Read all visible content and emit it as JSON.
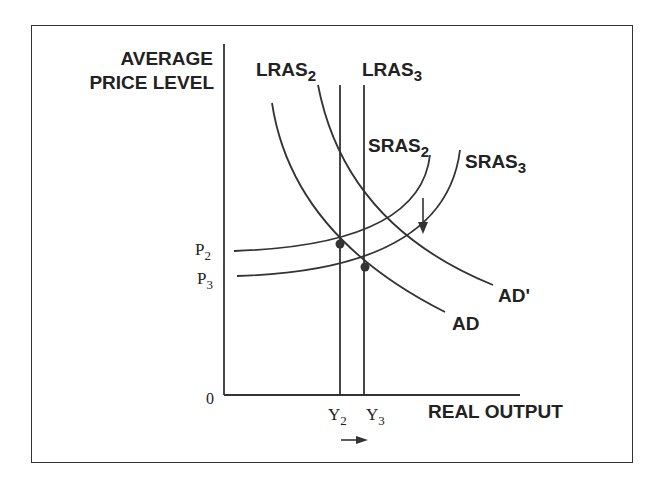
{
  "diagram": {
    "title": "",
    "y_axis": {
      "label_line1": "AVERAGE",
      "label_line2": "PRICE LEVEL"
    },
    "x_axis": {
      "label": "REAL OUTPUT"
    },
    "origin": "0",
    "price_ticks": [
      {
        "label": "P",
        "sub": "2"
      },
      {
        "label": "P",
        "sub": "3"
      }
    ],
    "output_ticks": [
      {
        "label": "Y",
        "sub": "2"
      },
      {
        "label": "Y",
        "sub": "3"
      }
    ],
    "curves": {
      "lras2": {
        "label": "LRAS",
        "sub": "2"
      },
      "lras3": {
        "label": "LRAS",
        "sub": "3"
      },
      "sras2": {
        "label": "SRAS",
        "sub": "2"
      },
      "sras3": {
        "label": "SRAS",
        "sub": "3"
      },
      "ad": {
        "label": "AD"
      },
      "ad_prime": {
        "label": "AD'"
      }
    },
    "equilibria": [
      {
        "name": "E2",
        "price": "P2",
        "output": "Y2"
      },
      {
        "name": "E3",
        "price": "P3",
        "output": "Y3"
      }
    ],
    "arrows": [
      {
        "name": "sras-shift-down",
        "direction": "down"
      },
      {
        "name": "output-increase",
        "direction": "right"
      }
    ],
    "colors": {
      "line": "#333333",
      "text": "#222222",
      "background": "#ffffff"
    }
  }
}
